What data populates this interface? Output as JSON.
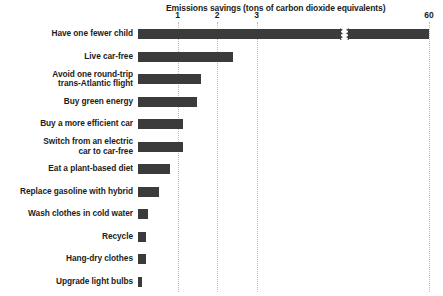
{
  "chart_data": {
    "type": "bar",
    "orientation": "horizontal",
    "title": "Emissions savings (tons of carbon dioxide equivalents)",
    "xlabel": "",
    "ylabel": "",
    "xlim": [
      0,
      3.7
    ],
    "grid": true,
    "legend": null,
    "axis_break": {
      "present": true,
      "note": "bar 'Have one fewer child' is truncated with a zig-zag break; its true value 58.6 is shown at the 60 tick"
    },
    "tick_labels": [
      "1",
      "2",
      "3",
      "60"
    ],
    "tick_values": [
      1,
      2,
      3,
      60
    ],
    "categories": [
      "Have one fewer child",
      "Live car-free",
      "Avoid one round-trip\ntrans-Atlantic flight",
      "Buy green energy",
      "Buy a more efficient car",
      "Switch from an electric\ncar to car-free",
      "Eat a plant-based diet",
      "Replace gasoline with hybrid",
      "Wash clothes in cold water",
      "Recycle",
      "Hang-dry clothes",
      "Upgrade light bulbs"
    ],
    "values": [
      58.6,
      2.4,
      1.6,
      1.5,
      1.15,
      1.15,
      0.8,
      0.52,
      0.25,
      0.21,
      0.21,
      0.1
    ],
    "colors": {
      "bar": "#3b3b3b",
      "grid": "#b9b9b9",
      "text": "#1c1c1c",
      "background": "#ffffff"
    }
  },
  "categories_display": [
    {
      "line1": "Have one fewer child",
      "line2": ""
    },
    {
      "line1": "Live car-free",
      "line2": ""
    },
    {
      "line1": "Avoid one round-trip",
      "line2": "trans-Atlantic flight"
    },
    {
      "line1": "Buy green energy",
      "line2": ""
    },
    {
      "line1": "Buy a more efficient car",
      "line2": ""
    },
    {
      "line1": "Switch from an electric",
      "line2": "car to car-free"
    },
    {
      "line1": "Eat a plant-based diet",
      "line2": ""
    },
    {
      "line1": "Replace gasoline with hybrid",
      "line2": ""
    },
    {
      "line1": "Wash clothes in cold water",
      "line2": ""
    },
    {
      "line1": "Recycle",
      "line2": ""
    },
    {
      "line1": "Hang-dry clothes",
      "line2": ""
    },
    {
      "line1": "Upgrade light bulbs",
      "line2": ""
    }
  ]
}
